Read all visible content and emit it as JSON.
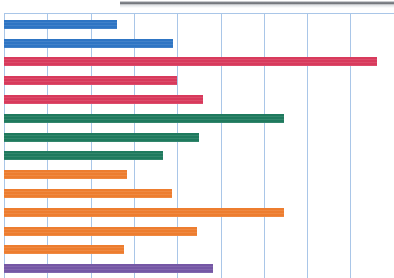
{
  "artifact": {
    "top_band_label": "scan-smudge-band"
  },
  "chart_data": {
    "type": "bar",
    "orientation": "horizontal",
    "title": "",
    "subtitle": "",
    "xlabel": "",
    "ylabel": "",
    "categories": [
      "",
      "",
      "",
      "",
      "",
      "",
      "",
      "",
      "",
      "",
      "",
      "",
      "",
      ""
    ],
    "values": [
      2.61,
      3.9,
      8.61,
      4.0,
      4.6,
      6.46,
      4.5,
      3.67,
      2.84,
      3.88,
      6.46,
      4.46,
      2.77,
      4.83
    ],
    "bar_colors": [
      "#2e75c4",
      "#2e75c4",
      "#d83a5c",
      "#d83a5c",
      "#d83a5c",
      "#1f7a5e",
      "#1f7a5e",
      "#1f7a5e",
      "#ed7d2f",
      "#ed7d2f",
      "#ed7d2f",
      "#ed7d2f",
      "#ed7d2f",
      "#7557a5"
    ],
    "group_colors": {
      "blue": "#2e75c4",
      "red": "#d83a5c",
      "green": "#1f7a5e",
      "orange": "#ed7d2f",
      "purple": "#7557a5"
    },
    "groups": [
      {
        "name": "blue-group",
        "color": "#2e75c4",
        "bar_count": 2
      },
      {
        "name": "red-group",
        "color": "#d83a5c",
        "bar_count": 3
      },
      {
        "name": "green-group",
        "color": "#1f7a5e",
        "bar_count": 3
      },
      {
        "name": "orange-group",
        "color": "#ed7d2f",
        "bar_count": 5
      },
      {
        "name": "purple-group",
        "color": "#7557a5",
        "bar_count": 1
      }
    ],
    "xlim": [
      0,
      9
    ],
    "xticks": [
      0,
      1,
      2,
      3,
      4,
      5,
      6,
      7,
      8,
      9
    ],
    "xtick_labels": [
      "",
      "",
      "",
      "",
      "",
      "",
      "",
      "",
      "",
      ""
    ],
    "grid": {
      "vertical": true,
      "horizontal": false,
      "color": "#a9c6e8"
    },
    "legend": {
      "visible": false,
      "position": "none"
    },
    "tick_labels_visible": false,
    "axis_labels_visible": false,
    "note": "Axis tick labels and category labels are cropped out of the visible screenshot; only plotted bars and vertical gridlines are rendered. Bottom bar is clipped by the image edge."
  },
  "layout": {
    "plot_left_px": 4,
    "plot_top_px": 13,
    "gridline_spacing_px": 43.3,
    "bar_height_px": 9,
    "bar_pitch_px": 18.8,
    "first_bar_top_px": 19.7
  }
}
